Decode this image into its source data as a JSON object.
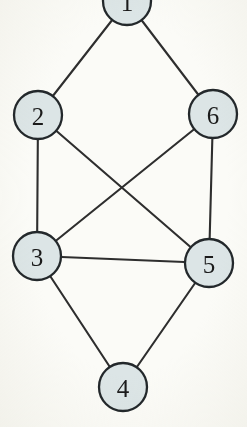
{
  "figure": {
    "background_color": "#fbfbf7",
    "node_fill_color": "#dce5e6",
    "node_stroke_color": "#23282b",
    "edge_color": "#2e2e2e",
    "label_color": "#1b1b1b",
    "node_radius": 24,
    "width": 247,
    "height": 427
  },
  "chart_data": {
    "type": "diagram",
    "diagram_type": "graph",
    "directed": false,
    "title": "",
    "node_count": 6,
    "edge_count": 9,
    "nodes": [
      {
        "id": "1",
        "label": "1",
        "x": 127,
        "y": 1,
        "r": 24
      },
      {
        "id": "2",
        "label": "2",
        "x": 38,
        "y": 115,
        "r": 24
      },
      {
        "id": "6",
        "label": "6",
        "x": 213,
        "y": 114,
        "r": 24
      },
      {
        "id": "3",
        "label": "3",
        "x": 37,
        "y": 256,
        "r": 24
      },
      {
        "id": "5",
        "label": "5",
        "x": 209,
        "y": 263,
        "r": 24
      },
      {
        "id": "4",
        "label": "4",
        "x": 123,
        "y": 387,
        "r": 24
      }
    ],
    "edges": [
      {
        "from": "1",
        "to": "2"
      },
      {
        "from": "1",
        "to": "6"
      },
      {
        "from": "2",
        "to": "3"
      },
      {
        "from": "2",
        "to": "5"
      },
      {
        "from": "6",
        "to": "5"
      },
      {
        "from": "6",
        "to": "3"
      },
      {
        "from": "3",
        "to": "5"
      },
      {
        "from": "3",
        "to": "4"
      },
      {
        "from": "5",
        "to": "4"
      }
    ],
    "adjacency": {
      "1": [
        "2",
        "6"
      ],
      "2": [
        "1",
        "3",
        "5"
      ],
      "3": [
        "2",
        "6",
        "5",
        "4"
      ],
      "4": [
        "3",
        "5"
      ],
      "5": [
        "2",
        "6",
        "3",
        "4"
      ],
      "6": [
        "1",
        "5",
        "3"
      ]
    },
    "degrees": {
      "1": 2,
      "2": 3,
      "3": 4,
      "4": 2,
      "5": 4,
      "6": 3
    }
  }
}
